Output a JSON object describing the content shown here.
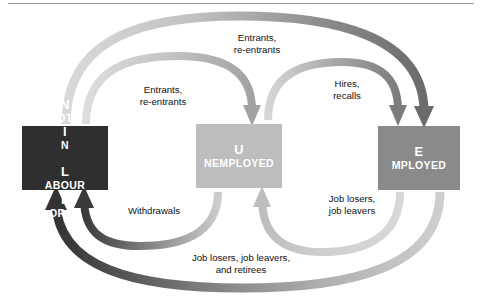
{
  "diagram": {
    "boxes": [
      {
        "id": "not-in-labour-force",
        "label": "Not in\nLabour Force",
        "color": "#2f2f2f"
      },
      {
        "id": "unemployed",
        "label": "Unemployed",
        "color": "#bdbdbd"
      },
      {
        "id": "employed",
        "label": "Employed",
        "color": "#8a8a8a"
      }
    ],
    "flow_labels": [
      {
        "id": "entrants-re-entrants-outer",
        "text": "Entrants,\nre-entrants"
      },
      {
        "id": "entrants-re-entrants-inner",
        "text": "Entrants,\nre-entrants"
      },
      {
        "id": "hires-recalls",
        "text": "Hires,\nrecalls"
      },
      {
        "id": "job-losers-job-leavers",
        "text": "Job losers,\njob leavers"
      },
      {
        "id": "withdrawals",
        "text": "Withdrawals"
      },
      {
        "id": "job-losers-leavers-retirees",
        "text": "Job losers, job leavers,\nand retirees"
      }
    ],
    "arrows": [
      {
        "id": "nilf-to-employed",
        "from": "not-in-labour-force",
        "to": "employed",
        "label": "Entrants, re-entrants",
        "tone": "dark"
      },
      {
        "id": "nilf-to-unemployed",
        "from": "not-in-labour-force",
        "to": "unemployed",
        "label": "Entrants, re-entrants",
        "tone": "light"
      },
      {
        "id": "unemployed-to-employed",
        "from": "unemployed",
        "to": "employed",
        "label": "Hires, recalls",
        "tone": "dark"
      },
      {
        "id": "employed-to-unemployed",
        "from": "employed",
        "to": "unemployed",
        "label": "Job losers, job leavers",
        "tone": "light"
      },
      {
        "id": "unemployed-to-nilf",
        "from": "unemployed",
        "to": "not-in-labour-force",
        "label": "Withdrawals",
        "tone": "dark"
      },
      {
        "id": "employed-to-nilf",
        "from": "employed",
        "to": "not-in-labour-force",
        "label": "Job losers, job leavers, and retirees",
        "tone": "dark"
      }
    ],
    "colors": {
      "box_dark": "#2f2f2f",
      "box_mid": "#8a8a8a",
      "box_light": "#bdbdbd",
      "arrow_light": "#d3d3d3",
      "arrow_dark": "#6e6e6e",
      "text": "#111111",
      "rule": "#9a9a9a"
    }
  }
}
